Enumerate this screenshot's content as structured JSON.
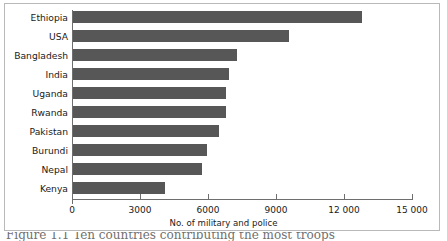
{
  "chart_data": {
    "type": "bar",
    "orientation": "horizontal",
    "title": "",
    "xlabel": "No. of military and police",
    "ylabel": "",
    "categories": [
      "Ethiopia",
      "USA",
      "Bangladesh",
      "India",
      "Uganda",
      "Rwanda",
      "Pakistan",
      "Burundi",
      "Nepal",
      "Kenya"
    ],
    "values": [
      12750,
      9530,
      7240,
      6880,
      6750,
      6750,
      6440,
      5910,
      5690,
      4060
    ],
    "xlim": [
      0,
      15000
    ],
    "xticks": [
      0,
      3000,
      6000,
      9000,
      12000,
      15000
    ],
    "xtick_labels": [
      "0",
      "3000",
      "6000",
      "9000",
      "12 000",
      "15 000"
    ],
    "grid": false,
    "legend": "none",
    "bar_color": "#575757",
    "axis_color": "#6e6e6e",
    "background": "#ffffff"
  },
  "figure": {
    "caption_partial": "Figure 1.1 Ten countries contributing the most troops"
  }
}
